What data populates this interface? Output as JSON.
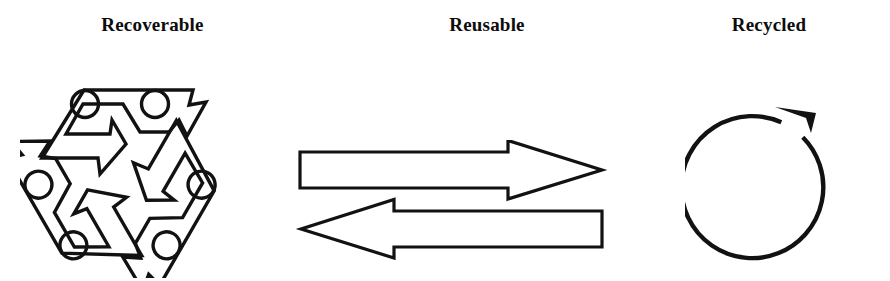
{
  "figure": {
    "background_color": "#ffffff",
    "ink_color": "#121212",
    "width": 890,
    "height": 281
  },
  "panels": [
    {
      "key": "recoverable",
      "title": "Recoverable",
      "symbol_name": "recycling-triangle-symbol",
      "symbol_description": "Three-arrow Mobius recycling loop with circles at the band corners",
      "arrow_count": 3,
      "circle_count": 6
    },
    {
      "key": "reusable",
      "title": "Reusable",
      "symbol_name": "two-way-arrows-symbol",
      "symbol_description": "Outlined arrow pointing right above an outlined arrow pointing left",
      "arrows": [
        {
          "name": "arrow-right",
          "direction": "right"
        },
        {
          "name": "arrow-left",
          "direction": "left"
        }
      ]
    },
    {
      "key": "recycled",
      "title": "Recycled",
      "symbol_name": "circular-arrow-symbol",
      "symbol_description": "Open circular loop with a solid arrowhead at the top pointing counter-clockwise",
      "arrow_count": 1
    }
  ]
}
